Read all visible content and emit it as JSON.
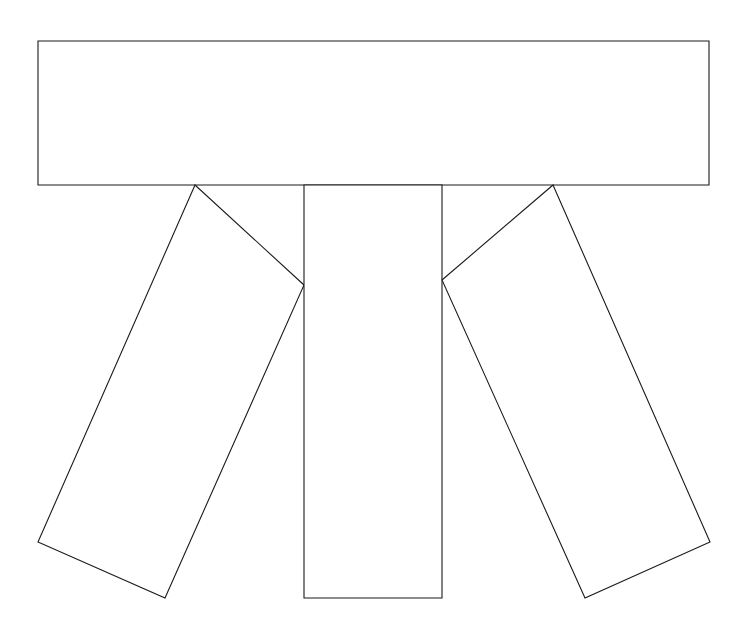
{
  "canvas": {
    "width": 748,
    "height": 633,
    "background_color": "#ffffff",
    "stroke_color": "#1a1a1a",
    "fill_color": "#ffffff",
    "stroke_width": 1.1
  },
  "figure": {
    "shape_count": 4,
    "shapes": [
      {
        "name": "horizontal-bar",
        "type": "rectangle",
        "points": "38,41 709,41 709,185 38,185",
        "fill": "#ffffff",
        "stroke": "#1a1a1a"
      },
      {
        "name": "left-leg",
        "type": "quadrilateral",
        "points": "195,185 38,542 165,598 304,285",
        "fill": "#ffffff",
        "stroke": "#1a1a1a"
      },
      {
        "name": "center-leg",
        "type": "rectangle",
        "points": "304,185 442,185 442,598 304,598",
        "fill": "#ffffff",
        "stroke": "#1a1a1a"
      },
      {
        "name": "right-leg",
        "type": "quadrilateral",
        "points": "553,185 710,542 585,598 442,280",
        "fill": "#ffffff",
        "stroke": "#1a1a1a"
      }
    ]
  }
}
